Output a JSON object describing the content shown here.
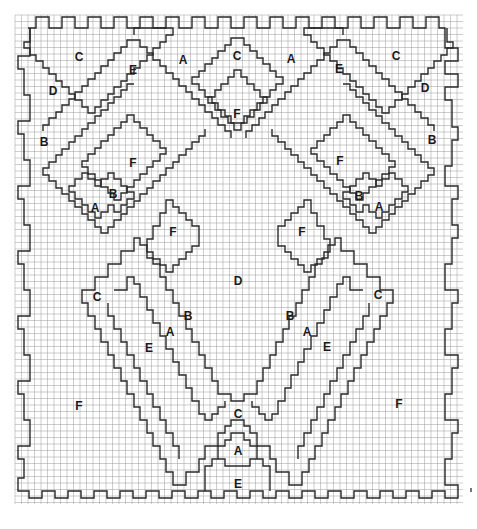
{
  "diagram": {
    "type": "needlepoint-bargello-chart",
    "grid": {
      "left": 15,
      "top": 15,
      "right": 463,
      "bottom": 504,
      "cell": 6.5,
      "line_color": "#9a9a9a",
      "outline_color": "#2a2a2a"
    },
    "labels": [
      {
        "text": "C",
        "x": 79,
        "y": 58
      },
      {
        "text": "A",
        "x": 183,
        "y": 61
      },
      {
        "text": "C",
        "x": 237,
        "y": 57
      },
      {
        "text": "A",
        "x": 291,
        "y": 60
      },
      {
        "text": "C",
        "x": 396,
        "y": 57
      },
      {
        "text": "E",
        "x": 133,
        "y": 71
      },
      {
        "text": "E",
        "x": 339,
        "y": 70
      },
      {
        "text": "D",
        "x": 53,
        "y": 92
      },
      {
        "text": "D",
        "x": 425,
        "y": 89
      },
      {
        "text": "F",
        "x": 237,
        "y": 115
      },
      {
        "text": "B",
        "x": 44,
        "y": 143
      },
      {
        "text": "B",
        "x": 432,
        "y": 141
      },
      {
        "text": "F",
        "x": 133,
        "y": 164
      },
      {
        "text": "F",
        "x": 340,
        "y": 162
      },
      {
        "text": "B",
        "x": 113,
        "y": 195
      },
      {
        "text": "B",
        "x": 359,
        "y": 197
      },
      {
        "text": "A",
        "x": 95,
        "y": 209
      },
      {
        "text": "A",
        "x": 379,
        "y": 208
      },
      {
        "text": "F",
        "x": 173,
        "y": 233
      },
      {
        "text": "F",
        "x": 302,
        "y": 233
      },
      {
        "text": "D",
        "x": 238,
        "y": 282
      },
      {
        "text": "C",
        "x": 97,
        "y": 298
      },
      {
        "text": "C",
        "x": 378,
        "y": 296
      },
      {
        "text": "B",
        "x": 188,
        "y": 317
      },
      {
        "text": "B",
        "x": 290,
        "y": 317
      },
      {
        "text": "A",
        "x": 170,
        "y": 333
      },
      {
        "text": "A",
        "x": 307,
        "y": 333
      },
      {
        "text": "E",
        "x": 149,
        "y": 349
      },
      {
        "text": "E",
        "x": 327,
        "y": 348
      },
      {
        "text": "F",
        "x": 79,
        "y": 407
      },
      {
        "text": "F",
        "x": 399,
        "y": 405
      },
      {
        "text": "C",
        "x": 238,
        "y": 415
      },
      {
        "text": "A",
        "x": 238,
        "y": 452
      },
      {
        "text": "E",
        "x": 238,
        "y": 485
      }
    ]
  }
}
